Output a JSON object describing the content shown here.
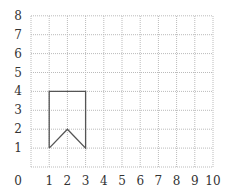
{
  "chart_data": {
    "type": "line",
    "title": "",
    "xlabel": "",
    "ylabel": "",
    "xlim": [
      0,
      10
    ],
    "ylim": [
      0,
      8
    ],
    "grid": true,
    "grid_style": "dotted",
    "x_ticks": [
      "0",
      "1",
      "2",
      "3",
      "4",
      "5",
      "6",
      "7",
      "8",
      "9",
      "10"
    ],
    "y_ticks": [
      "1",
      "2",
      "3",
      "4",
      "5",
      "6",
      "7",
      "8"
    ],
    "series": [
      {
        "name": "shape",
        "closed": true,
        "points": [
          [
            1,
            1
          ],
          [
            1,
            4
          ],
          [
            3,
            4
          ],
          [
            3,
            1
          ],
          [
            2,
            2
          ],
          [
            1,
            1
          ]
        ]
      }
    ]
  },
  "colors": {
    "grid": "#bbbbbb",
    "shape": "#555555",
    "labels": "#333333"
  }
}
